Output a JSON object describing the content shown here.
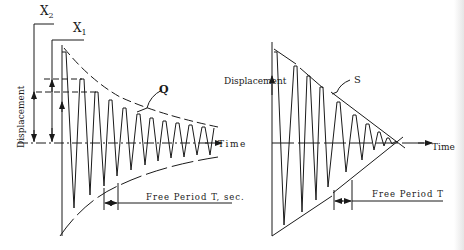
{
  "figure": {
    "left_panel": {
      "title": "Viscous damping decay",
      "labels": {
        "x2": "X",
        "x2_sub": "2",
        "x1": "X",
        "x1_sub": "1",
        "ylabel": "Displacement",
        "xlabel": "Time",
        "envelope": "Q",
        "period": "Free Period T, sec."
      }
    },
    "right_panel": {
      "title": "Friction damping decay",
      "labels": {
        "ylabel": "Displacement",
        "xlabel": "Time",
        "envelope": "S",
        "period": "Free Period T"
      }
    },
    "colors": {
      "ink": "#1a1a1a",
      "background": "#ffffff"
    }
  }
}
